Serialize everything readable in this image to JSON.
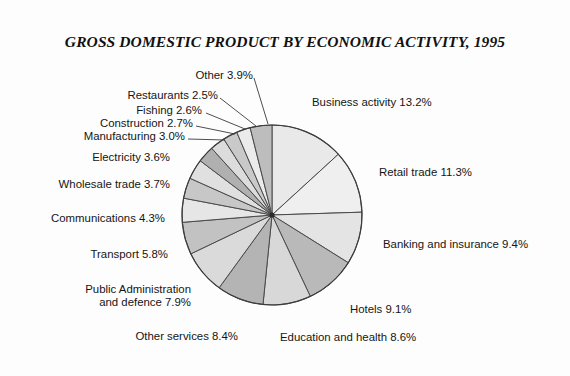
{
  "chart_data": {
    "type": "pie",
    "title": "GROSS DOMESTIC PRODUCT BY ECONOMIC ACTIVITY, 1995",
    "xlabel": "",
    "ylabel": "",
    "unit": "%",
    "legend": "none",
    "grid": false,
    "categories": [
      "Business activity",
      "Retail trade",
      "Banking and insurance",
      "Hotels",
      "Education and health",
      "Other services",
      "Public Administration and defence",
      "Transport",
      "Communications",
      "Wholesale trade",
      "Electricity",
      "Manufacturing",
      "Construction",
      "Fishing",
      "Restaurants",
      "Other"
    ],
    "values": [
      13.2,
      11.3,
      9.4,
      9.1,
      8.6,
      8.4,
      7.9,
      5.8,
      4.3,
      3.7,
      3.6,
      3.0,
      2.7,
      2.6,
      2.5,
      3.9
    ],
    "slice_fills": [
      "#e9e9e9",
      "#efefef",
      "#e4e4e4",
      "#b9b9b9",
      "#d8d8d8",
      "#b4b4b4",
      "#dadada",
      "#c2c2c2",
      "#e6e6e6",
      "#c7c7c7",
      "#e0e0e0",
      "#b0b0b0",
      "#dcdcdc",
      "#c9c9c9",
      "#ebebeb",
      "#bdbdbd"
    ],
    "slice_stroke": "#4a4a4a",
    "start_angle_deg": -90,
    "labels": [
      {
        "key": "business-activity",
        "text": "Business activity 13.2%",
        "x": 312,
        "y": 96,
        "align": "right"
      },
      {
        "key": "retail-trade",
        "text": "Retail trade 11.3%",
        "x": 379,
        "y": 166,
        "align": "right"
      },
      {
        "key": "banking-insurance",
        "text": "Banking and insurance 9.4%",
        "x": 383,
        "y": 238,
        "align": "right"
      },
      {
        "key": "hotels",
        "text": "Hotels 9.1%",
        "x": 350,
        "y": 303,
        "align": "right"
      },
      {
        "key": "education-health",
        "text": "Education and health 8.6%",
        "x": 280,
        "y": 331,
        "align": "right"
      },
      {
        "key": "other-services",
        "text": "Other services 8.4%",
        "x": 238,
        "y": 330,
        "align": "left"
      },
      {
        "key": "public-admin",
        "text": "Public Administration",
        "x": 191,
        "y": 283,
        "align": "left"
      },
      {
        "key": "public-admin-2",
        "text": "and defence 7.9%",
        "x": 191,
        "y": 296,
        "align": "left"
      },
      {
        "key": "transport",
        "text": "Transport 5.8%",
        "x": 168,
        "y": 248,
        "align": "left"
      },
      {
        "key": "communications",
        "text": "Communications 4.3%",
        "x": 165,
        "y": 212,
        "align": "left"
      },
      {
        "key": "wholesale-trade",
        "text": "Wholesale trade 3.7%",
        "x": 170,
        "y": 178,
        "align": "left"
      },
      {
        "key": "electricity",
        "text": "Electricity 3.6%",
        "x": 170,
        "y": 151,
        "align": "left"
      },
      {
        "key": "manufacturing",
        "text": "Manufacturing 3.0%",
        "x": 185,
        "y": 130,
        "align": "left"
      },
      {
        "key": "construction",
        "text": "Construction 2.7%",
        "x": 193,
        "y": 117,
        "align": "left"
      },
      {
        "key": "fishing",
        "text": "Fishing 2.6%",
        "x": 202,
        "y": 104,
        "align": "left"
      },
      {
        "key": "restaurants",
        "text": "Restaurants 2.5%",
        "x": 218,
        "y": 89,
        "align": "left"
      },
      {
        "key": "other",
        "text": "Other 3.9%",
        "x": 253,
        "y": 69,
        "align": "left"
      }
    ],
    "leader_lines": [
      {
        "key": "other",
        "x1": 254,
        "y1": 78,
        "x2": 268,
        "y2": 124
      },
      {
        "key": "restaurants",
        "x1": 220,
        "y1": 98,
        "x2": 256,
        "y2": 126
      },
      {
        "key": "fishing",
        "x1": 206,
        "y1": 113,
        "x2": 245,
        "y2": 129
      },
      {
        "key": "construction",
        "x1": 196,
        "y1": 126,
        "x2": 235,
        "y2": 134
      },
      {
        "key": "manufacturing",
        "x1": 188,
        "y1": 139,
        "x2": 225,
        "y2": 140
      }
    ],
    "center": {
      "x": 272,
      "y": 215
    },
    "radius": 90
  }
}
